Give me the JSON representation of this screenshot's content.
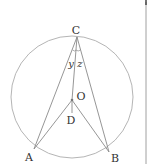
{
  "diagram": {
    "type": "geometry-circle",
    "colors": {
      "background": "#ffffff",
      "circle": "#b5b5b5",
      "lines": "#8a8a8a",
      "labels": "#333333",
      "edge_rule": "#a0a0a0"
    },
    "circle": {
      "cx": 72,
      "cy": 97,
      "r": 61
    },
    "points": {
      "C": {
        "label": "C",
        "x": 77,
        "y": 37,
        "lx": 76,
        "ly": 34
      },
      "O": {
        "label": "O",
        "x": 72,
        "y": 100,
        "lx": 81,
        "ly": 100
      },
      "D": {
        "label": "D",
        "x": 72,
        "y": 113,
        "lx": 71,
        "ly": 124
      },
      "A": {
        "label": "A",
        "x": 34,
        "y": 149,
        "lx": 29,
        "ly": 161
      },
      "B": {
        "label": "B",
        "x": 109,
        "y": 152,
        "lx": 115,
        "ly": 162
      }
    },
    "angle_labels": {
      "y": {
        "label": "y",
        "x": 71,
        "y": 67
      },
      "z": {
        "label": "z",
        "x": 80,
        "y": 67
      }
    },
    "segments": [
      "CA",
      "CB",
      "CO",
      "OA",
      "OB",
      "OD"
    ]
  }
}
